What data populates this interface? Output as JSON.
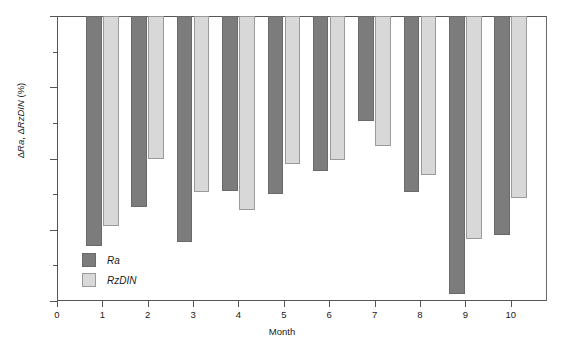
{
  "chart_data": {
    "type": "bar",
    "title": "",
    "xlabel": "Month",
    "ylabel": "ΔRa, ΔRzDIN (%)",
    "categories": [
      "1",
      "2",
      "3",
      "4",
      "5",
      "6",
      "7",
      "8",
      "9",
      "10"
    ],
    "series": [
      {
        "name": "Ra",
        "color": "#7c7c7c",
        "values": [
          -12.9,
          -10.7,
          -12.7,
          -9.8,
          -10.0,
          -8.7,
          -5.9,
          -9.9,
          -15.6,
          -12.3
        ]
      },
      {
        "name": "RzDIN",
        "color": "#d8d8d8",
        "values": [
          -11.8,
          -8.0,
          -9.9,
          -10.9,
          -8.3,
          -8.1,
          -7.3,
          -8.9,
          -12.5,
          -10.2
        ]
      }
    ],
    "ylim": [
      -16,
      0
    ],
    "xlim": [
      0,
      10.8
    ],
    "y_major_ticks": [
      0,
      -4,
      -8,
      -12,
      -16
    ],
    "y_major_tick_labels": [
      "0",
      "−4",
      "−8",
      "−12",
      "−16"
    ],
    "y_minor_ticks": [
      -2,
      -6,
      -10,
      -14
    ],
    "x_ticks": [
      0,
      1,
      2,
      3,
      4,
      5,
      6,
      7,
      8,
      9,
      10
    ],
    "x_tick_labels": [
      "0",
      "1",
      "2",
      "3",
      "4",
      "5",
      "6",
      "7",
      "8",
      "9",
      "10"
    ],
    "grid": false,
    "legend_position": "inside-lower-left",
    "legend_entries": [
      "Ra",
      "RzDIN"
    ]
  },
  "axes": {
    "y_label_delta": "Δ",
    "y_label_ra": "Ra",
    "y_label_sep": ", ",
    "y_label_rz": "RzDIN",
    "y_label_unit": " (%)"
  }
}
